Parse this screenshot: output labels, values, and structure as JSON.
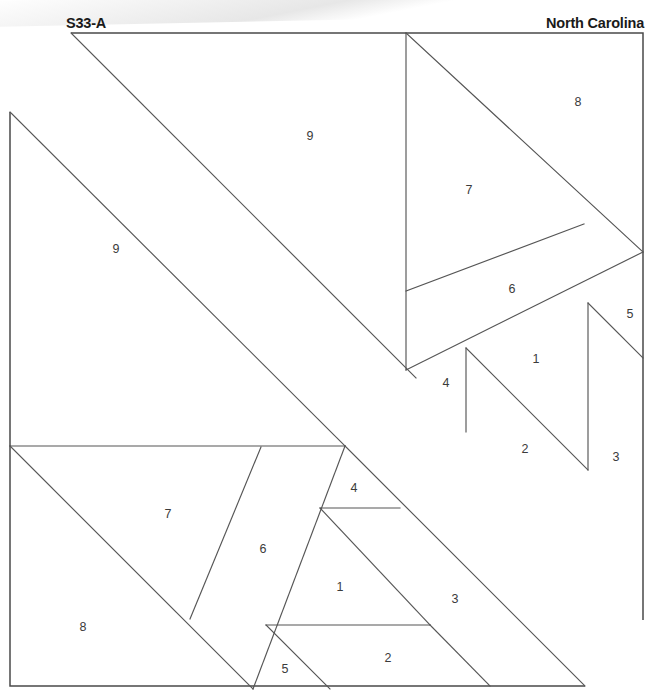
{
  "page": {
    "width": 652,
    "height": 696,
    "background": "#ffffff",
    "line_color": "#555555",
    "frame_color": "#4a4a4a",
    "label_color": "#3b3b3b"
  },
  "header": {
    "block_code": "S33-A",
    "state_name": "North Carolina"
  },
  "pattern": {
    "title": "S33-A",
    "type": "quilt-block-foundation-piecing-diagram",
    "symmetry": "180-degree rotational",
    "frame": {
      "top_left": [
        71,
        33
      ],
      "top_right": [
        643,
        33
      ],
      "right_lower": [
        643,
        620
      ],
      "left_upper": [
        10,
        112
      ],
      "bottom_left": [
        10,
        686
      ],
      "bottom_right": [
        585,
        686
      ]
    },
    "piece_labels": [
      {
        "id": "label-9-upper",
        "number": "9",
        "x": 310,
        "y": 137
      },
      {
        "id": "label-8-upper",
        "number": "8",
        "x": 578,
        "y": 103
      },
      {
        "id": "label-7-upper",
        "number": "7",
        "x": 469,
        "y": 191
      },
      {
        "id": "label-6-upper",
        "number": "6",
        "x": 512,
        "y": 290
      },
      {
        "id": "label-5-upper",
        "number": "5",
        "x": 630,
        "y": 315
      },
      {
        "id": "label-1-upper",
        "number": "1",
        "x": 536,
        "y": 360
      },
      {
        "id": "label-4-upper",
        "number": "4",
        "x": 446,
        "y": 384
      },
      {
        "id": "label-2-upper",
        "number": "2",
        "x": 525,
        "y": 450
      },
      {
        "id": "label-3-upper",
        "number": "3",
        "x": 616,
        "y": 458
      },
      {
        "id": "label-9-lower",
        "number": "9",
        "x": 116,
        "y": 250
      },
      {
        "id": "label-7-lower",
        "number": "7",
        "x": 168,
        "y": 515
      },
      {
        "id": "label-6-lower",
        "number": "6",
        "x": 263,
        "y": 550
      },
      {
        "id": "label-4-lower",
        "number": "4",
        "x": 354,
        "y": 489
      },
      {
        "id": "label-1-lower",
        "number": "1",
        "x": 340,
        "y": 588
      },
      {
        "id": "label-3-lower",
        "number": "3",
        "x": 455,
        "y": 600
      },
      {
        "id": "label-8-lower",
        "number": "8",
        "x": 83,
        "y": 628
      },
      {
        "id": "label-5-lower",
        "number": "5",
        "x": 285,
        "y": 670
      },
      {
        "id": "label-2-lower",
        "number": "2",
        "x": 388,
        "y": 659
      }
    ],
    "segments": [
      {
        "id": "band-upper-edge",
        "from": [
          71,
          33
        ],
        "to": [
          416,
          378
        ]
      },
      {
        "id": "band-lower-edge",
        "from": [
          10,
          112
        ],
        "to": [
          345,
          446
        ]
      },
      {
        "id": "div-vert-upper-406",
        "from": [
          406,
          33
        ],
        "to": [
          406,
          370
        ]
      },
      {
        "id": "div-diag-8-7",
        "from": [
          406,
          33
        ],
        "to": [
          643,
          252
        ]
      },
      {
        "id": "div-6-top",
        "from": [
          406,
          291
        ],
        "to": [
          584,
          224
        ]
      },
      {
        "id": "div-6-bottom",
        "from": [
          406,
          370
        ],
        "to": [
          643,
          252
        ]
      },
      {
        "id": "div-vert-right-588",
        "from": [
          588,
          303
        ],
        "to": [
          588,
          470
        ]
      },
      {
        "id": "div-5-diag",
        "from": [
          588,
          303
        ],
        "to": [
          643,
          358
        ]
      },
      {
        "id": "div-vert-466-1",
        "from": [
          466,
          348
        ],
        "to": [
          466,
          432
        ]
      },
      {
        "id": "div-diag-1-2",
        "from": [
          466,
          348
        ],
        "to": [
          588,
          470
        ]
      },
      {
        "id": "div-vert-643-right",
        "from": [
          643,
          33
        ],
        "to": [
          643,
          620
        ]
      },
      {
        "id": "div-bottom-left-frame",
        "from": [
          10,
          446
        ],
        "to": [
          345,
          446
        ]
      },
      {
        "id": "div-7-8-diag",
        "from": [
          10,
          446
        ],
        "to": [
          253,
          689
        ]
      },
      {
        "id": "div-6-left",
        "from": [
          261,
          447
        ],
        "to": [
          190,
          619
        ]
      },
      {
        "id": "div-6-right",
        "from": [
          345,
          446
        ],
        "to": [
          253,
          689
        ]
      },
      {
        "id": "div-vert-5-line",
        "from": [
          266,
          625
        ],
        "to": [
          430,
          625
        ]
      },
      {
        "id": "div-4-line",
        "from": [
          320,
          508
        ],
        "to": [
          400,
          508
        ]
      },
      {
        "id": "div-1-3-diag",
        "from": [
          320,
          508
        ],
        "to": [
          430,
          625
        ]
      },
      {
        "id": "div-2-diag-lower",
        "from": [
          266,
          625
        ],
        "to": [
          330,
          689
        ]
      },
      {
        "id": "div-3-diag-lower",
        "from": [
          345,
          446
        ],
        "to": [
          585,
          686
        ]
      },
      {
        "id": "div-2-diag-right",
        "from": [
          430,
          625
        ],
        "to": [
          490,
          686
        ]
      }
    ]
  }
}
